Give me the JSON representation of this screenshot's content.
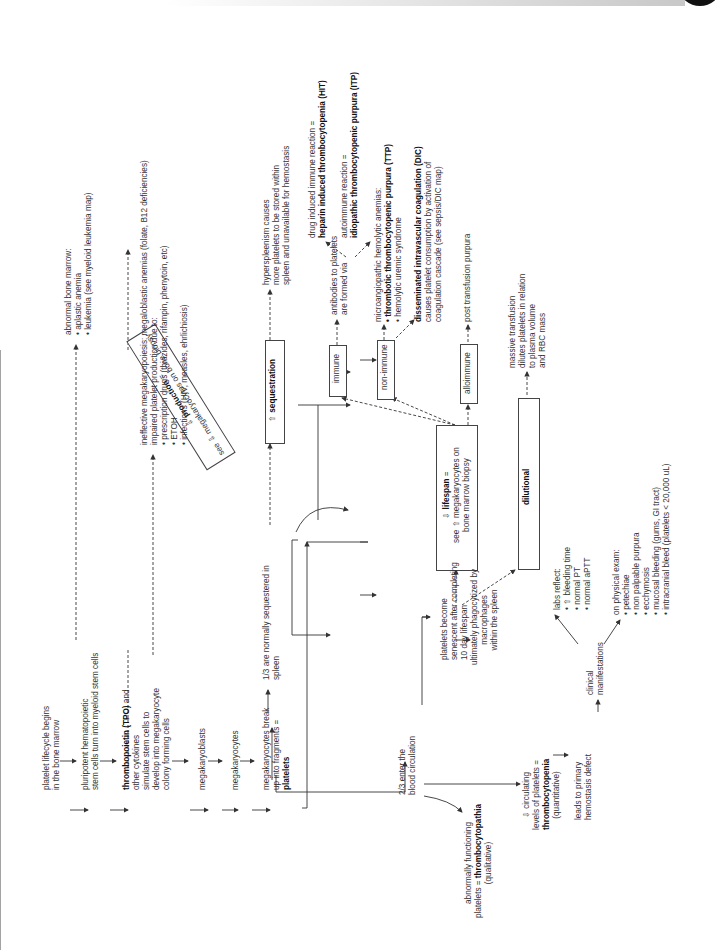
{
  "diagram": {
    "lifecycle": {
      "step1": [
        "platelet lifecycle begins",
        "in the bone marrow"
      ],
      "step2": [
        "pluripotent hematopoietic",
        "stem cells turn into myeloid stem cells"
      ],
      "step3_bold": "thrombopoietin (TPO)",
      "step3": [
        " and",
        "other cytokines",
        "simulate stem cells to",
        "develop into megakaryocyte",
        "colony forming cells"
      ],
      "step4": "megakaryoblasts",
      "step5": "megakaryocytes",
      "step6": [
        "megakaryocytes break",
        "up into fragments ="
      ],
      "step6_bold": "platelets"
    },
    "production_box": {
      "symbol": "⇩",
      "bold": "production",
      "eq": " =",
      "line2": "see ⇩ megakaryocytes on bone biopsy"
    },
    "abnormal_marrow": {
      "title": "abnormal bone marrow:",
      "items": [
        "aplastic anemia",
        "leukemia (see myeloid leukemia map)"
      ]
    },
    "ineffective": {
      "line1": "ineffective megakaryopoiesis: megaloblastic anemias (folate, B12 deficiencies)",
      "line2": "impaired platelet production due to:",
      "items": [
        "prescription drugs (thiazides, rifampin, phenytoin, etc)",
        "ETOH",
        "infections (HIV, measles, ehrlichiosis)"
      ]
    },
    "spleen": {
      "one_third": [
        "1/3 are normally sequestered in",
        "spleen"
      ],
      "sequestration_symbol": "⇧",
      "sequestration_label": "sequestration",
      "hypersplenism": [
        "hyperspleenism causes",
        "more platelets to be stored within",
        "spleen and unavailable for hemostasis"
      ]
    },
    "lifespan_box": {
      "symbol": "⇩",
      "bold": "lifespan",
      "eq": " =",
      "lines": [
        "see ⇧ megakaryocytes on",
        "bone marrow biopsy"
      ]
    },
    "immune": {
      "label": "immune",
      "antibodies": [
        "antibodies to platelets",
        "are formed via"
      ],
      "hit_pre": "drug induced immune reaction =",
      "hit_bold": "heparin induced thrombocytopenia (HIT)",
      "itp_pre": "autoimmune reaction =",
      "itp_bold": "idiopathic thrombocytopenic purpura (ITP)"
    },
    "non_immune": {
      "label": "non-immune",
      "micro_title": "microangiopathic hemolytic anemias:",
      "ttp_bold": "thrombotic thrombocytopenic purpura (TTP)",
      "hus": "hemolytic uremic syndrome",
      "dic_bold": "disseminated intravascular coagulation (DIC)",
      "dic_lines": [
        "causes platelet consumption by activation of",
        "coagulation cascade (see sepsis/DIC map)"
      ]
    },
    "alloimmune": {
      "label": "alloimmune",
      "text": "post transfusion purpura"
    },
    "dilutional": {
      "label": "dilutional",
      "text": [
        "massive transfusion",
        "dilutes platelets in relation",
        "to plasma volume",
        "and RBC mass"
      ]
    },
    "circulation": {
      "two_thirds": [
        "2/3 enter the",
        "blood circulation"
      ],
      "senescent": [
        "platelets become",
        "senescent after completing",
        "10 day lifespan"
      ],
      "phagocytized": [
        "ultimately phagocytized by",
        "macrophages",
        "within the spleen"
      ],
      "abnormal": [
        "abnormally functioning",
        "platelets = "
      ],
      "abnormal_bold": "thrombocytopathia",
      "qualitative": "(qualitative)",
      "decreased": [
        "⇩ circulating",
        "levels of platelets ="
      ],
      "decreased_bold": "thrombocytopenia",
      "quantitative": "(quantitative)",
      "leads": [
        "leads to primary",
        "hemostasis defect"
      ],
      "clinical": [
        "clinical",
        "manifestations"
      ]
    },
    "labs": {
      "title": "labs reflect:",
      "items": [
        "⇧ bleeding time",
        "normal PT",
        "normal aPTT"
      ]
    },
    "exam": {
      "title": "on physical exam:",
      "items": [
        "petechiae",
        "non palpable purpura",
        "ecchymosis",
        "mucosal bleeding (gums, GI tract)",
        "intracranial bleed (platelets < 20,000 uL)"
      ]
    }
  }
}
